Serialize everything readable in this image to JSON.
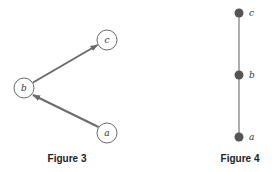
{
  "figures": [
    {
      "caption": "Figure 3",
      "type": "directed-graph",
      "nodes": [
        {
          "id": "c",
          "label": "c",
          "x": 107,
          "y": 40
        },
        {
          "id": "b",
          "label": "b",
          "x": 24,
          "y": 88
        },
        {
          "id": "a",
          "label": "a",
          "x": 107,
          "y": 133
        }
      ],
      "edges": [
        {
          "from": "a",
          "to": "b"
        },
        {
          "from": "b",
          "to": "c"
        }
      ]
    },
    {
      "caption": "Figure 4",
      "type": "hasse-diagram",
      "nodes": [
        {
          "id": "c",
          "label": "c",
          "x": 239,
          "y": 13
        },
        {
          "id": "b",
          "label": "b",
          "x": 239,
          "y": 75
        },
        {
          "id": "a",
          "label": "a",
          "x": 239,
          "y": 137
        }
      ],
      "edges": [
        {
          "from": "a",
          "to": "b"
        },
        {
          "from": "b",
          "to": "c"
        }
      ]
    }
  ],
  "colors": {
    "edge": "#6b6b6b",
    "node_outline": "#6b6b6b",
    "dot_fill": "#555555"
  }
}
